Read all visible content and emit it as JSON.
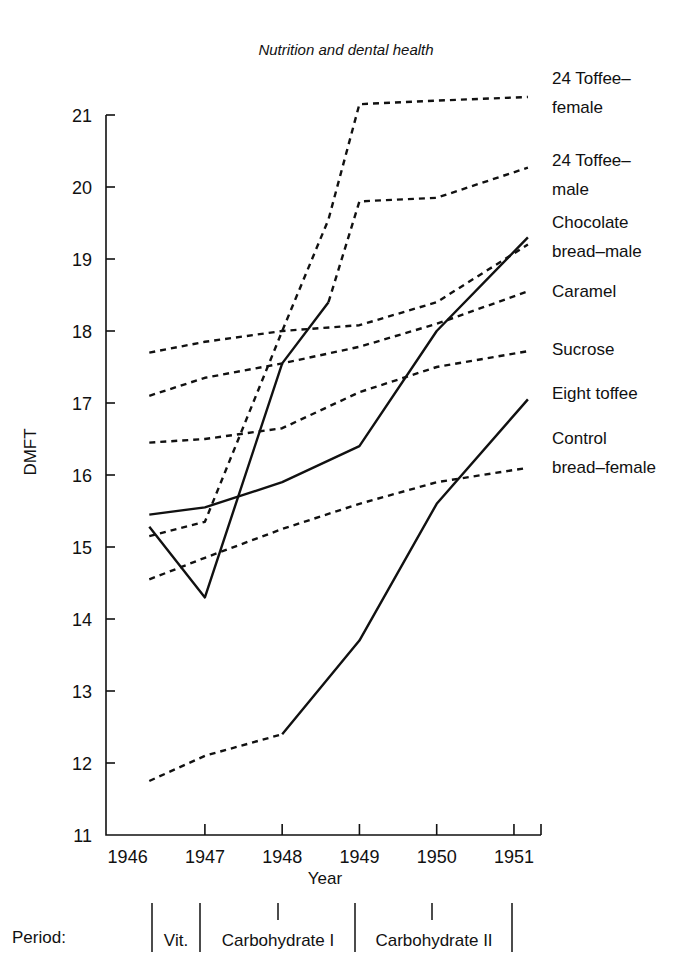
{
  "title": "Nutrition and dental health",
  "axes": {
    "ylabel": "DMFT",
    "xlabel": "Year",
    "yticks": [
      11,
      12,
      13,
      14,
      15,
      16,
      17,
      18,
      19,
      20,
      21
    ],
    "xticks": [
      "1946",
      "1947",
      "1948",
      "1949",
      "1950",
      "1951"
    ],
    "ylim": [
      11,
      21.35
    ],
    "xlim": [
      1945.72,
      1951.35
    ]
  },
  "period": {
    "label": "Period:",
    "segments": [
      "Vit.",
      "Carbohydrate I",
      "Carbohydrate II"
    ]
  },
  "chart_data": {
    "type": "line",
    "title": "Nutrition and dental health",
    "xlabel": "Year",
    "ylabel": "DMFT",
    "xlim": [
      1945.72,
      1951.35
    ],
    "ylim": [
      11,
      21.35
    ],
    "grid": false,
    "legend_position": "right-of-plot-end-labels",
    "x": [
      1946,
      1947,
      1948,
      1949,
      1950,
      1951
    ],
    "series": [
      {
        "name": "24 Toffee-female",
        "label": "24 Toffee–\nfemale",
        "label_lines": [
          "24 Toffee–",
          "female"
        ],
        "style": "dashed",
        "x": [
          1946.28,
          1947,
          1948,
          1948.6,
          1949,
          1950,
          1951.18
        ],
        "values": [
          15.15,
          15.35,
          18.0,
          19.55,
          21.15,
          21.2,
          21.25
        ]
      },
      {
        "name": "24 Toffee-male",
        "label_lines": [
          "24 Toffee–",
          "male"
        ],
        "style": "dashed",
        "x": [
          1946.28,
          1947,
          1948,
          1948.6,
          1949,
          1950,
          1951.18
        ],
        "values": [
          15.28,
          14.3,
          17.55,
          18.4,
          19.8,
          19.85,
          20.27
        ],
        "solid_until": 1948.6
      },
      {
        "name": "Chocolate bread-male",
        "label_lines": [
          "Chocolate",
          "bread–male"
        ],
        "style": "solid",
        "x": [
          1946.28,
          1947,
          1948,
          1949,
          1950,
          1951.18
        ],
        "values": [
          15.45,
          15.55,
          15.9,
          16.4,
          18.0,
          19.3
        ]
      },
      {
        "name": "Caramel",
        "label_lines": [
          "Caramel"
        ],
        "style": "dashed",
        "x": [
          1946.28,
          1947,
          1948,
          1949,
          1950,
          1951.18
        ],
        "values": [
          17.1,
          17.35,
          17.55,
          17.78,
          18.1,
          18.55
        ]
      },
      {
        "name": "Sucrose",
        "label_lines": [
          "Sucrose"
        ],
        "style": "dashed",
        "x": [
          1946.28,
          1947,
          1948,
          1949,
          1950,
          1951.18
        ],
        "values": [
          16.45,
          16.5,
          16.65,
          17.15,
          17.5,
          17.72
        ]
      },
      {
        "name": "Eight toffee",
        "label_lines": [
          "Eight toffee"
        ],
        "style": "solid",
        "x": [
          1948,
          1949,
          1950,
          1951.18
        ],
        "values": [
          12.4,
          13.7,
          15.6,
          17.05
        ]
      },
      {
        "name": "Control bread-female",
        "label_lines": [
          "Control",
          "bread–female"
        ],
        "style": "dashed",
        "x": [
          1946.28,
          1947,
          1948,
          1949,
          1950,
          1951.18
        ],
        "values": [
          14.55,
          14.85,
          15.25,
          15.6,
          15.9,
          16.1
        ]
      },
      {
        "name": "Upper dashed 17.7",
        "label_lines": [],
        "style": "dashed",
        "x": [
          1946.28,
          1947,
          1948,
          1949,
          1950,
          1951.18
        ],
        "values": [
          17.7,
          17.85,
          18.0,
          18.08,
          18.4,
          19.2
        ]
      },
      {
        "name": "Lower dashed 11.75",
        "label_lines": [],
        "style": "dashed",
        "x": [
          1946.28,
          1947,
          1948
        ],
        "values": [
          11.75,
          12.1,
          12.4
        ]
      }
    ]
  }
}
